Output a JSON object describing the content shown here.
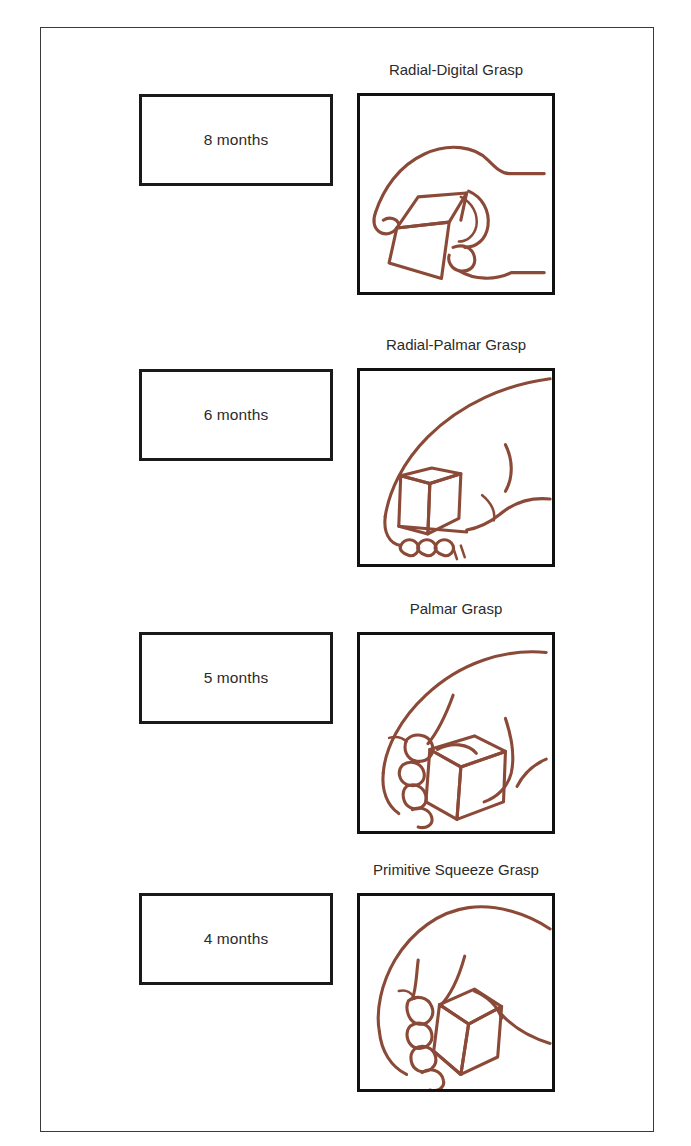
{
  "figure": {
    "title_caption": "",
    "background_color": "#ffffff",
    "frame_color": "#3a3a3a",
    "ink_color": "#8B4A38",
    "box_border_color": "#111111"
  },
  "rows": [
    {
      "age_label": "8 months",
      "grasp_title": "Radial-Digital Grasp",
      "illustration": "hand-grasping-cube-radial-digital"
    },
    {
      "age_label": "6 months",
      "grasp_title": "Radial-Palmar Grasp",
      "illustration": "hand-grasping-cube-radial-palmar"
    },
    {
      "age_label": "5 months",
      "grasp_title": "Palmar Grasp",
      "illustration": "hand-grasping-cube-palmar"
    },
    {
      "age_label": "4 months",
      "grasp_title": "Primitive Squeeze Grasp",
      "illustration": "hand-grasping-cube-primitive-squeeze"
    }
  ]
}
